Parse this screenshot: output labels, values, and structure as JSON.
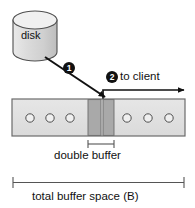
{
  "figure": {
    "background": "#ffffff"
  },
  "disk": {
    "label": "disk",
    "fill": "#d4d4d4",
    "top_fill": "#ececec",
    "stroke": "#4a4a4a"
  },
  "steps": [
    {
      "id": "step-1",
      "number": "1",
      "badge_fill": "#111111",
      "badge_text": "#ffffff"
    },
    {
      "id": "step-2",
      "number": "2",
      "badge_fill": "#111111",
      "badge_text": "#ffffff"
    }
  ],
  "flow": {
    "to_client_label": "to client",
    "arrow_color": "#111111"
  },
  "buffer": {
    "fill": "#e0e0e0",
    "stroke": "#6b6b6b",
    "double_buffer_fill": "#a8a8a8",
    "slot_stroke": "#5a5a5a",
    "slot_fill": "#ececec",
    "left_slots": 3,
    "right_slots": 3
  },
  "dimensions": {
    "double_buffer": {
      "label": "double buffer",
      "tick_color": "#555555"
    },
    "total_buffer": {
      "label": "total buffer space (B)",
      "tick_color": "#555555"
    }
  }
}
